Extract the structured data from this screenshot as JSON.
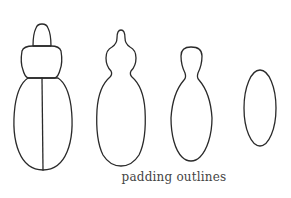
{
  "figure": {
    "caption": "padding outlines",
    "stroke_color": "#2a2a2a",
    "background": "#ffffff",
    "shapes": [
      {
        "id": "beetle-outline",
        "description": "original segmented beetle-like outline with head, prothorax, and split elytra"
      },
      {
        "id": "padded-outline-1",
        "description": "first padding: merged smooth silhouette with pointed head"
      },
      {
        "id": "padded-outline-2",
        "description": "second padding: smoother bowling-pin silhouette"
      },
      {
        "id": "padded-outline-3",
        "description": "final padding: simple ellipse"
      }
    ]
  }
}
